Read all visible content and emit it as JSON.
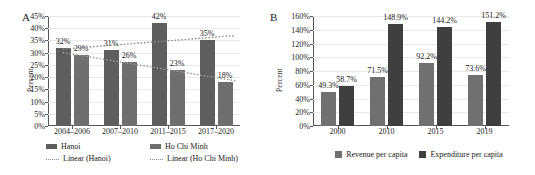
{
  "figure": {
    "panel_a_letter": "A",
    "panel_b_letter": "B"
  },
  "colors": {
    "hanoi": "#5e5e5e",
    "ho_chi_minh": "#6f6f6f",
    "revenue": "#707070",
    "expenditure": "#3f3f3f",
    "trend_hanoi": "#8a8a8a",
    "trend_hcm": "#9a9a9a",
    "grid": "#e9e9e9",
    "axis": "#555555"
  },
  "chart_data": [
    {
      "type": "bar",
      "panel": "A",
      "title": "",
      "xlabel": "",
      "ylabel": "Percent",
      "ylim": [
        0,
        45
      ],
      "yticks": [
        "0%",
        "5%",
        "10%",
        "15%",
        "20%",
        "25%",
        "30%",
        "35%",
        "40%",
        "45%"
      ],
      "ytick_values": [
        0,
        5,
        10,
        15,
        20,
        25,
        30,
        35,
        40,
        45
      ],
      "grid": true,
      "legend_position": "bottom",
      "categories": [
        "2004–2006",
        "2007–2010",
        "2011–2015",
        "2017–2020"
      ],
      "series": [
        {
          "name": "Hanoi",
          "values": [
            32,
            31,
            42,
            35
          ],
          "labels": [
            "32%",
            "31%",
            "42%",
            "35%"
          ]
        },
        {
          "name": "Ho Chi Minh",
          "values": [
            29,
            26,
            23,
            18
          ],
          "labels": [
            "29%",
            "26%",
            "23%",
            "18%"
          ]
        }
      ],
      "trendlines": [
        {
          "name": "Linear (Hanoi)",
          "start": 31.5,
          "end": 37.0,
          "style": "dotted"
        },
        {
          "name": "Linear (Ho Chi Minh)",
          "start": 30.0,
          "end": 18.5,
          "style": "dotted"
        }
      ],
      "legend": [
        {
          "label": "Hanoi",
          "type": "bar"
        },
        {
          "label": "Ho Chi Minh",
          "type": "bar"
        },
        {
          "label": "Linear (Hanoi)",
          "type": "line"
        },
        {
          "label": "Linear (Ho Chi Minh)",
          "type": "line"
        }
      ]
    },
    {
      "type": "bar",
      "panel": "B",
      "title": "",
      "xlabel": "",
      "ylabel": "Percent",
      "ylim": [
        0,
        160
      ],
      "yticks": [
        "0%",
        "20%",
        "40%",
        "60%",
        "80%",
        "100%",
        "120%",
        "140%",
        "160%"
      ],
      "ytick_values": [
        0,
        20,
        40,
        60,
        80,
        100,
        120,
        140,
        160
      ],
      "grid": true,
      "legend_position": "bottom",
      "categories": [
        "2000",
        "2010",
        "2015",
        "2019"
      ],
      "series": [
        {
          "name": "Revenue per capita",
          "values": [
            49.3,
            71.5,
            92.2,
            73.6
          ],
          "labels": [
            "49.3%",
            "71.5%",
            "92.2%",
            "73.6%"
          ]
        },
        {
          "name": "Expenditure per capita",
          "values": [
            58.7,
            148.9,
            144.2,
            151.2
          ],
          "labels": [
            "58.7%",
            "148.9%",
            "144.2%",
            "151.2%"
          ]
        }
      ],
      "legend": [
        {
          "label": "Revenue per capita",
          "type": "bar"
        },
        {
          "label": "Expenditure per capita",
          "type": "bar"
        }
      ]
    }
  ]
}
